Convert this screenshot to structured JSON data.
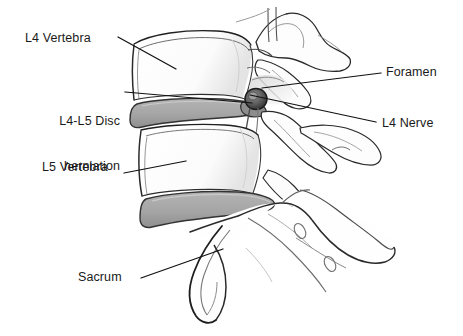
{
  "figure": {
    "width": 463,
    "height": 336,
    "background_color": "#ffffff"
  },
  "colors": {
    "outline": "#1a1a1a",
    "outline_light": "#595959",
    "disc_fill": "#a8a8a8",
    "disc_stroke": "#3c3c3c",
    "bone_fill": "#ffffff",
    "bone_shade": "#e8e8e8",
    "nerve_fill": "#4a4a4a",
    "label_text": "#1a1a1a",
    "leader_line": "#111111"
  },
  "labels": [
    {
      "id": "l4-vertebra",
      "text": "L4 Vertebra",
      "align": "left",
      "leader": {
        "x1": 118,
        "y1": 37,
        "x2": 176,
        "y2": 69
      }
    },
    {
      "id": "herniation",
      "line1": "L4-L5 Disc",
      "line2": "herniation",
      "text": "L4-L5 Disc herniation",
      "align": "right",
      "leader": {
        "x1": 125,
        "y1": 92,
        "x2": 252,
        "y2": 103
      }
    },
    {
      "id": "l5-vertebra",
      "text": "L5 Vertebra",
      "align": "left",
      "leader": {
        "x1": 124,
        "y1": 173,
        "x2": 186,
        "y2": 161
      }
    },
    {
      "id": "sacrum",
      "text": "Sacrum",
      "align": "left",
      "leader": {
        "x1": 141,
        "y1": 278,
        "x2": 223,
        "y2": 249
      }
    },
    {
      "id": "foramen",
      "text": "Foramen",
      "align": "left",
      "leader": {
        "x1": 381,
        "y1": 73,
        "x2": 262,
        "y2": 88
      }
    },
    {
      "id": "l4-nerve",
      "text": "L4 Nerve",
      "align": "left",
      "leader": {
        "x1": 376,
        "y1": 122,
        "x2": 250,
        "y2": 95
      }
    }
  ],
  "structures": [
    {
      "name": "l4-vertebral-body",
      "type": "bone"
    },
    {
      "name": "l4-posterior-elements",
      "type": "bone"
    },
    {
      "name": "l5-vertebral-body",
      "type": "bone"
    },
    {
      "name": "l5-posterior-elements",
      "type": "bone"
    },
    {
      "name": "l4-l5-disc-herniation",
      "type": "disc"
    },
    {
      "name": "l5-s1-disc",
      "type": "disc"
    },
    {
      "name": "l4-nerve-root",
      "type": "nerve"
    },
    {
      "name": "intervertebral-foramen",
      "type": "space"
    },
    {
      "name": "sacrum",
      "type": "bone"
    }
  ]
}
